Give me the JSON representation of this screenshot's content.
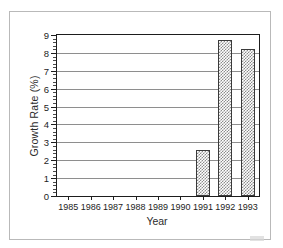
{
  "chart_data": {
    "type": "bar",
    "title": "",
    "subtitle": "",
    "xlabel": "Year",
    "ylabel": "Growth Rate (%)",
    "categories": [
      "1985",
      "1986",
      "1987",
      "1988",
      "1989",
      "1990",
      "1991",
      "1992",
      "1993"
    ],
    "values": [
      0,
      0,
      0,
      0,
      0,
      0,
      2.6,
      8.7,
      8.2
    ],
    "series": [
      {
        "name": "Growth Rate (%)",
        "values": [
          0,
          0,
          0,
          0,
          0,
          0,
          2.6,
          8.7,
          8.2
        ]
      }
    ],
    "ylim": [
      0,
      9
    ],
    "xlim_categories": 9,
    "y_ticks": [
      0,
      1,
      2,
      3,
      4,
      5,
      6,
      7,
      8,
      9
    ],
    "y_tick_labels": [
      "0",
      "1",
      "2",
      "3",
      "4",
      "5",
      "6",
      "7",
      "8",
      "9"
    ],
    "y_minor_ticks_per_interval": 4,
    "grid": true,
    "grid_orientation": "horizontal",
    "legend": false,
    "legend_position": "none",
    "annotations": [],
    "bar_fill": "gray-crosshatch-pattern",
    "bar_edge_color": "#3a3a3a",
    "bar_fill_color": "#8c8c8c",
    "axis_color": "#1d1d1d",
    "gridline_color": "#8e8e8e",
    "background_color": "#ffffff",
    "frame_color": "#b9b9b9"
  }
}
